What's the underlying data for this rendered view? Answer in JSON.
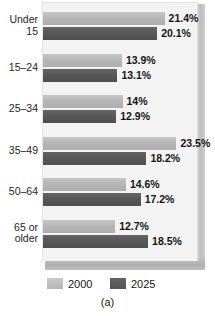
{
  "chart_data": {
    "type": "bar",
    "orientation": "horizontal",
    "title": "",
    "xlabel": "",
    "ylabel": "",
    "xlim": [
      0,
      25
    ],
    "grid": false,
    "legend_position": "bottom",
    "categories": [
      "Under\n15",
      "15–24",
      "25–34",
      "35–49",
      "50–64",
      "65 or\nolder"
    ],
    "series": [
      {
        "name": "2000",
        "color": "#b6b6b6",
        "values": [
          21.4,
          13.9,
          14,
          23.5,
          14.6,
          12.7
        ],
        "labels": [
          "21.4%",
          "13.9%",
          "14%",
          "23.5%",
          "14.6%",
          "12.7%"
        ]
      },
      {
        "name": "2025",
        "color": "#585858",
        "values": [
          20.1,
          13.1,
          12.9,
          18.2,
          17.2,
          18.5
        ],
        "labels": [
          "20.1%",
          "13.1%",
          "12.9%",
          "18.2%",
          "17.2%",
          "18.5%"
        ]
      }
    ],
    "caption": "(a)"
  },
  "legend": {
    "items": [
      {
        "label": "2000",
        "swatch": "light"
      },
      {
        "label": "2025",
        "swatch": "dark"
      }
    ]
  },
  "caption": "(a)",
  "colors": {
    "series_2000": "#b6b6b6",
    "series_2025": "#585858",
    "panel_background": "#f3f3f3",
    "panel_edge": "#bdbdbd",
    "text": "#161616",
    "page_background": "#ffffff"
  }
}
